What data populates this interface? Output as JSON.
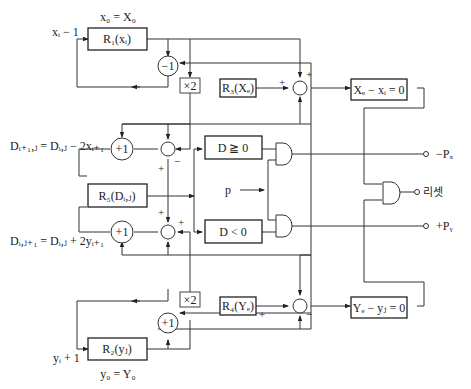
{
  "diagram": {
    "labels": {
      "x_init": "x₀ = X₀",
      "x_input": "xᵢ − 1",
      "y_init": "y₀ = Y₀",
      "y_input": "yᵢ + 1",
      "d_eq_upper": "Dᵢ₊₁,ⱼ = Dᵢ,ⱼ − 2xᵢ₊₁",
      "d_eq_lower": "Dᵢ,ⱼ₊₁ = Dᵢ,ⱼ + 2yᵢ₊₁",
      "p_input": "p"
    },
    "registers": {
      "r1": "R₁(xᵢ)",
      "r2": "R₂(yⱼ)",
      "r3": "R₃(Xₑ)",
      "r4": "R₄(Yₑ)",
      "r5": "R₅(Dᵢ,ⱼ)"
    },
    "operators": {
      "minus_one": "−1",
      "plus_one_upper": "+1",
      "plus_one_lower": "+1",
      "plus_one_y": "+1",
      "times_two_upper": "×2",
      "times_two_lower": "×2"
    },
    "comparators": {
      "d_ge_zero": "D ≧ 0",
      "d_lt_zero": "D < 0",
      "x_done": "Xₑ − xᵢ = 0",
      "y_done": "Yₑ − yⱼ = 0"
    },
    "outputs": {
      "neg_px": "−Pₓ",
      "reset": "리셋",
      "pos_py": "+Pᵧ"
    },
    "signs": {
      "plus": "+",
      "minus": "−"
    }
  }
}
